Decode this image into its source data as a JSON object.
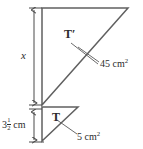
{
  "figure": {
    "stroke_color": "#555555",
    "text_color": "#2b2b2b",
    "background": "#ffffff",
    "labels": {
      "height_unknown": "x",
      "triangle_large": "T′",
      "triangle_small": "T",
      "area_large": "45 cm",
      "area_large_exponent": "2",
      "area_small": "5 cm",
      "area_small_exponent": "2",
      "height_known_whole": "3",
      "height_known_numerator": "1",
      "height_known_denominator": "2",
      "height_known_unit": "cm"
    },
    "geometry": {
      "large_triangle": {
        "name": "T-prime",
        "points": "42,8 128,8 42,105",
        "area_cm2": 45,
        "height_label": "x"
      },
      "small_triangle": {
        "name": "T",
        "points": "42,107 78,107 42,141",
        "area_cm2": 5,
        "height_cm": 3.5
      },
      "dimension_x": {
        "x": 34,
        "y1": 8,
        "y2": 104
      },
      "dimension_h": {
        "x": 34,
        "y1": 110,
        "y2": 142
      },
      "leader_tprime": {
        "x1": 72,
        "y1": 42,
        "x2": 96,
        "y2": 62
      },
      "leader_area_large": {
        "x1": 98,
        "y1": 63,
        "x2": 80,
        "y2": 49
      },
      "leader_area_small": {
        "x1": 76,
        "y1": 135,
        "x2": 58,
        "y2": 121
      }
    }
  }
}
